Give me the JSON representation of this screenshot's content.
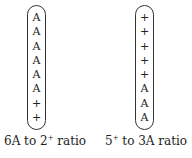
{
  "diagrams": [
    {
      "symbols": [
        "A",
        "A",
        "A",
        "A",
        "A",
        "A",
        "+",
        "+"
      ],
      "label_prefix": "6A to 2",
      "label_sup": "+",
      "label_suffix": " ratio"
    },
    {
      "symbols": [
        "+",
        "+",
        "+",
        "+",
        "+",
        "A",
        "A",
        "A"
      ],
      "label_prefix": "5",
      "label_sup": "+",
      "label_suffix": " to 3A ratio"
    }
  ]
}
